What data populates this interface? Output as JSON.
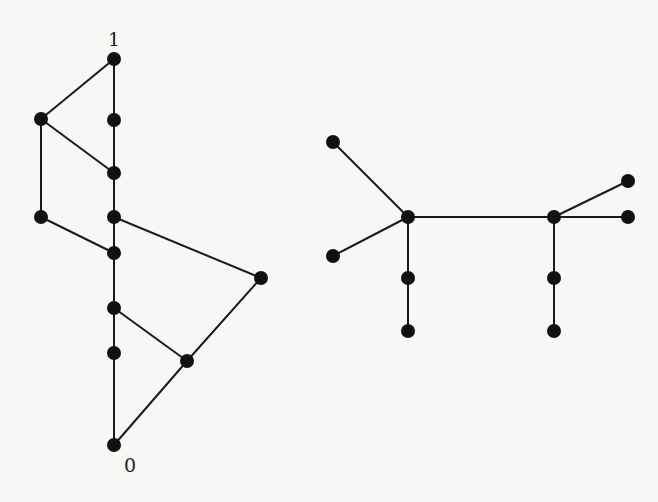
{
  "figure": {
    "background": "#f7f7f5",
    "node_color": "#111111",
    "edge_color": "#1a1a1a",
    "graphs": [
      {
        "name": "left-lattice",
        "labels": [
          {
            "id": "top",
            "text": "1",
            "x": 114,
            "y": 46
          },
          {
            "id": "bottom",
            "text": "0",
            "x": 130,
            "y": 472
          }
        ],
        "nodes": [
          {
            "id": "n1",
            "x": 114,
            "y": 59
          },
          {
            "id": "a",
            "x": 114,
            "y": 120
          },
          {
            "id": "l1",
            "x": 41,
            "y": 119
          },
          {
            "id": "b",
            "x": 114,
            "y": 173
          },
          {
            "id": "l2",
            "x": 41,
            "y": 217
          },
          {
            "id": "c",
            "x": 114,
            "y": 217
          },
          {
            "id": "d",
            "x": 114,
            "y": 253
          },
          {
            "id": "r",
            "x": 261,
            "y": 278
          },
          {
            "id": "e",
            "x": 114,
            "y": 308
          },
          {
            "id": "f",
            "x": 114,
            "y": 353
          },
          {
            "id": "g",
            "x": 187,
            "y": 361
          },
          {
            "id": "n0",
            "x": 114,
            "y": 445
          }
        ],
        "edges": [
          [
            "n1",
            "a"
          ],
          [
            "n1",
            "l1"
          ],
          [
            "a",
            "b"
          ],
          [
            "l1",
            "b"
          ],
          [
            "l1",
            "l2"
          ],
          [
            "b",
            "c"
          ],
          [
            "c",
            "d"
          ],
          [
            "l2",
            "d"
          ],
          [
            "c",
            "r"
          ],
          [
            "d",
            "e"
          ],
          [
            "e",
            "f"
          ],
          [
            "e",
            "g"
          ],
          [
            "r",
            "g"
          ],
          [
            "f",
            "n0"
          ],
          [
            "g",
            "n0"
          ]
        ]
      },
      {
        "name": "right-tree",
        "labels": [],
        "nodes": [
          {
            "id": "t1",
            "x": 333,
            "y": 142
          },
          {
            "id": "h1",
            "x": 408,
            "y": 217
          },
          {
            "id": "t2",
            "x": 333,
            "y": 256
          },
          {
            "id": "p1",
            "x": 408,
            "y": 278
          },
          {
            "id": "p2",
            "x": 408,
            "y": 331
          },
          {
            "id": "h2",
            "x": 554,
            "y": 217
          },
          {
            "id": "t3",
            "x": 628,
            "y": 181
          },
          {
            "id": "t4",
            "x": 628,
            "y": 217
          },
          {
            "id": "q1",
            "x": 554,
            "y": 278
          },
          {
            "id": "q2",
            "x": 554,
            "y": 331
          }
        ],
        "edges": [
          [
            "t1",
            "h1"
          ],
          [
            "t2",
            "h1"
          ],
          [
            "h1",
            "p1"
          ],
          [
            "p1",
            "p2"
          ],
          [
            "h1",
            "h2"
          ],
          [
            "h2",
            "t3"
          ],
          [
            "h2",
            "t4"
          ],
          [
            "h2",
            "q1"
          ],
          [
            "q1",
            "q2"
          ]
        ]
      }
    ]
  }
}
